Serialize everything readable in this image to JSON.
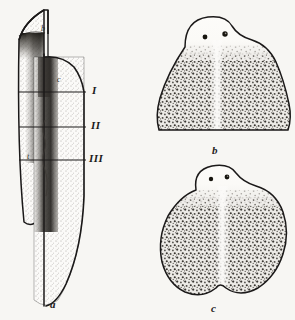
{
  "plate": {
    "title": "Regeneration stages of a flatworm (planarian)",
    "background_color": "#f7f6f3",
    "ink_color": "#1d1b1b",
    "width": 295,
    "height": 320
  },
  "panels": [
    {
      "id": "a",
      "letter": "a",
      "caption": "a",
      "description": "Lateral / whole-animal view of elongated worm body with two overlapping outlines, showing three transverse section levels",
      "letter_x": 50,
      "letter_y": 299
    },
    {
      "id": "b",
      "letter": "b",
      "caption": "b",
      "description": "Broad triangular anterior blastema with two eyespots and dark pigment mottling",
      "letter_x": 212,
      "letter_y": 145
    },
    {
      "id": "c",
      "letter": "c",
      "caption": "c",
      "description": "Rounded bilobed body with two eyespots and dark pigment mottling",
      "letter_x": 211,
      "letter_y": 303
    }
  ],
  "section_lines": [
    {
      "label": "I",
      "y": 92,
      "x1": 19,
      "x2": 86,
      "label_x": 92,
      "label_y": 85
    },
    {
      "label": "II",
      "y": 127,
      "x1": 19,
      "x2": 86,
      "label_x": 91,
      "label_y": 120
    },
    {
      "label": "III",
      "y": 160,
      "x1": 19,
      "x2": 86,
      "label_x": 89,
      "label_y": 153
    }
  ],
  "inner_marks": [
    {
      "label": "b",
      "x": 41,
      "y": 25
    },
    {
      "label": "c",
      "x": 57,
      "y": 76
    },
    {
      "label": "t",
      "x": 27,
      "y": 153
    }
  ],
  "eyespots": {
    "panel_b": [
      {
        "cx": 205,
        "cy": 37,
        "r": 2.4
      },
      {
        "cx": 225,
        "cy": 34,
        "r": 2.6
      }
    ],
    "panel_c": [
      {
        "cx": 211,
        "cy": 179,
        "r": 2.2
      },
      {
        "cx": 227,
        "cy": 177,
        "r": 2.3
      }
    ]
  },
  "colors": {
    "paper": "#f7f6f3",
    "outline": "#1b1919",
    "stipple_light": "#8f8b86",
    "stipple_dark": "#2e2b28",
    "label_text": "#1d1b1b"
  }
}
